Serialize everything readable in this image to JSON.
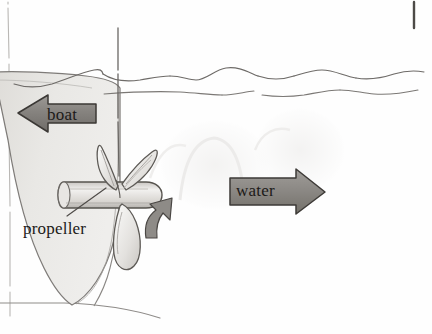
{
  "diagram": {
    "medium": "hand-drawn pencil on paper",
    "background_color": "#fefefe",
    "ink_color": "#4a4744",
    "arrow_fill_color": "#8d8a86",
    "hull_fill_color": "#e6e5e2",
    "labels": {
      "boat": "boat",
      "water": "water",
      "propeller": "propeller"
    },
    "arrows": [
      {
        "name": "boat-arrow",
        "label": "boat",
        "direction": "left",
        "meaning": "direction the boat moves"
      },
      {
        "name": "water-arrow",
        "label": "water",
        "direction": "right",
        "meaning": "direction the water is pushed"
      },
      {
        "name": "thrust-arrow",
        "label": "",
        "direction": "up",
        "meaning": "small curved arrow at the propeller"
      }
    ],
    "elements": [
      "boat-hull",
      "waterline-wave-upper",
      "waterline-wave-lower",
      "propeller-shaft",
      "propeller-hub",
      "propeller-blades",
      "leader-line",
      "margin-rule-left",
      "margin-rule-bottom",
      "margin-mark-top-right"
    ]
  }
}
